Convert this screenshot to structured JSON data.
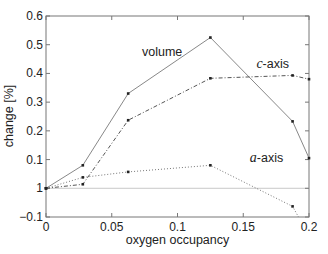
{
  "chart_data": {
    "type": "line",
    "title": "",
    "xlabel": "oxygen occupancy",
    "ylabel": "change [%]",
    "xlim": [
      0,
      0.2
    ],
    "ylim": [
      -0.1,
      0.6
    ],
    "xticks": [
      0,
      0.05,
      0.1,
      0.15,
      0.2
    ],
    "xtick_labels": [
      "0",
      "0.05",
      "0.1",
      "0.15",
      "0.2"
    ],
    "yticks": [
      -0.1,
      0,
      0.1,
      0.2,
      0.3,
      0.4,
      0.5,
      0.6
    ],
    "ytick_labels": [
      "−0.1",
      "1",
      "0.1",
      "0.2",
      "0.3",
      "0.4",
      "0.5",
      "0.6"
    ],
    "grid": false,
    "legend": "none (inline annotations)",
    "zero_line": true,
    "series": [
      {
        "name": "volume",
        "style": "solid",
        "color": "#888888",
        "x": [
          0,
          0.028,
          0.0625,
          0.125,
          0.1875,
          0.2
        ],
        "y": [
          0,
          0.08,
          0.33,
          0.525,
          0.233,
          0.105
        ]
      },
      {
        "name": "c-axis",
        "style": "dashdot",
        "color": "#555555",
        "x": [
          0,
          0.028,
          0.0625,
          0.125,
          0.1875,
          0.2
        ],
        "y": [
          0,
          0.014,
          0.237,
          0.383,
          0.393,
          0.38
        ]
      },
      {
        "name": "a-axis",
        "style": "dotted",
        "color": "#777777",
        "x": [
          0,
          0.028,
          0.0625,
          0.125,
          0.1875,
          0.192
        ],
        "y": [
          0,
          0.038,
          0.057,
          0.08,
          -0.063,
          -0.1
        ]
      }
    ],
    "annotations": [
      {
        "text_prefix": "",
        "text_italic": "",
        "text": "volume",
        "x": 0.073,
        "y": 0.46
      },
      {
        "text_prefix": "",
        "text_italic": "c",
        "text": "-axis",
        "x": 0.16,
        "y": 0.42
      },
      {
        "text_prefix": "",
        "text_italic": "a",
        "text": "-axis",
        "x": 0.155,
        "y": 0.09
      }
    ]
  }
}
